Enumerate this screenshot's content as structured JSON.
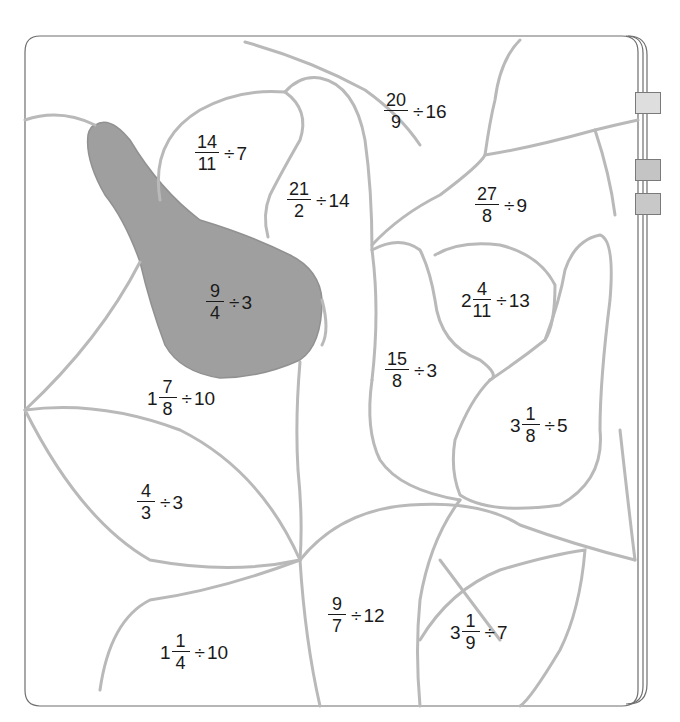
{
  "worksheet": {
    "type": "color-by-number fraction division",
    "shaded_region_color": "#9a9a9a",
    "line_color": "#b9b9b9",
    "tab_colors": [
      "#dedede",
      "#c4c4c4",
      "#c8c8c8"
    ],
    "problems": [
      {
        "id": "p1",
        "whole": "",
        "numerator": "14",
        "denominator": "11",
        "operator": "÷",
        "divisor": "7",
        "shaded": false
      },
      {
        "id": "p2",
        "whole": "",
        "numerator": "21",
        "denominator": "2",
        "operator": "÷",
        "divisor": "14",
        "shaded": false
      },
      {
        "id": "p3",
        "whole": "",
        "numerator": "20",
        "denominator": "9",
        "operator": "÷",
        "divisor": "16",
        "shaded": false
      },
      {
        "id": "p4",
        "whole": "",
        "numerator": "27",
        "denominator": "8",
        "operator": "÷",
        "divisor": "9",
        "shaded": false
      },
      {
        "id": "p5",
        "whole": "",
        "numerator": "9",
        "denominator": "4",
        "operator": "÷",
        "divisor": "3",
        "shaded": true
      },
      {
        "id": "p6",
        "whole": "2",
        "numerator": "4",
        "denominator": "11",
        "operator": "÷",
        "divisor": "13",
        "shaded": false
      },
      {
        "id": "p7",
        "whole": "",
        "numerator": "15",
        "denominator": "8",
        "operator": "÷",
        "divisor": "3",
        "shaded": false
      },
      {
        "id": "p8",
        "whole": "1",
        "numerator": "7",
        "denominator": "8",
        "operator": "÷",
        "divisor": "10",
        "shaded": false
      },
      {
        "id": "p9",
        "whole": "3",
        "numerator": "1",
        "denominator": "8",
        "operator": "÷",
        "divisor": "5",
        "shaded": false
      },
      {
        "id": "p10",
        "whole": "",
        "numerator": "4",
        "denominator": "3",
        "operator": "÷",
        "divisor": "3",
        "shaded": false
      },
      {
        "id": "p11",
        "whole": "",
        "numerator": "9",
        "denominator": "7",
        "operator": "÷",
        "divisor": "12",
        "shaded": false
      },
      {
        "id": "p12",
        "whole": "1",
        "numerator": "1",
        "denominator": "4",
        "operator": "÷",
        "divisor": "10",
        "shaded": false
      },
      {
        "id": "p13",
        "whole": "3",
        "numerator": "1",
        "denominator": "9",
        "operator": "÷",
        "divisor": "7",
        "shaded": false
      }
    ]
  }
}
